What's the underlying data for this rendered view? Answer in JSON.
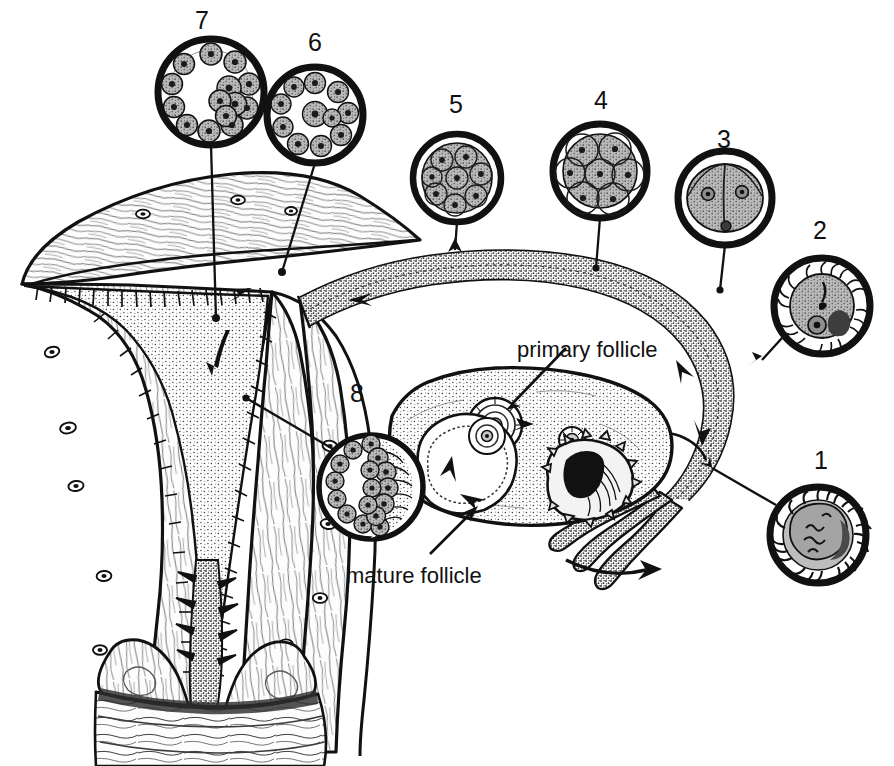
{
  "figure": {
    "background_color": "#ffffff",
    "ink_color": "#111111",
    "fill_gray": "#9a9a9a",
    "fill_light": "#f4f4f4",
    "width": 894,
    "height": 766
  },
  "text_labels": [
    {
      "id": "primary-follicle",
      "text": "primary follicle",
      "x": 517,
      "y": 339
    },
    {
      "id": "mature-follicle",
      "text": "mature follicle",
      "x": 346,
      "y": 565
    }
  ],
  "stage_numbers": [
    {
      "id": "stage-7",
      "label": "7",
      "x": 195,
      "y": 8,
      "stage_name": "blastocyst"
    },
    {
      "id": "stage-6",
      "label": "6",
      "x": 308,
      "y": 30,
      "stage_name": "early blastocyst"
    },
    {
      "id": "stage-5",
      "label": "5",
      "x": 449,
      "y": 92,
      "stage_name": "morula"
    },
    {
      "id": "stage-4",
      "label": "4",
      "x": 594,
      "y": 88,
      "stage_name": "eight-cell stage"
    },
    {
      "id": "stage-3",
      "label": "3",
      "x": 717,
      "y": 127,
      "stage_name": "two-cell stage"
    },
    {
      "id": "stage-2",
      "label": "2",
      "x": 813,
      "y": 218,
      "stage_name": "zygote"
    },
    {
      "id": "stage-1",
      "label": "1",
      "x": 814,
      "y": 448,
      "stage_name": "fertilization"
    },
    {
      "id": "stage-8",
      "label": "8",
      "x": 350,
      "y": 381,
      "stage_name": "implantation"
    }
  ],
  "inset_circles": [
    {
      "id": "inset-7",
      "cx": 211,
      "cy": 92,
      "r": 53,
      "stage": "7"
    },
    {
      "id": "inset-6",
      "cx": 315,
      "cy": 115,
      "r": 48,
      "stage": "6"
    },
    {
      "id": "inset-5",
      "cx": 457,
      "cy": 178,
      "r": 44,
      "stage": "5"
    },
    {
      "id": "inset-4",
      "cx": 600,
      "cy": 171,
      "r": 47,
      "stage": "4"
    },
    {
      "id": "inset-3",
      "cx": 725,
      "cy": 198,
      "r": 47,
      "stage": "3"
    },
    {
      "id": "inset-2",
      "cx": 822,
      "cy": 306,
      "r": 48,
      "stage": "2"
    },
    {
      "id": "inset-1",
      "cx": 818,
      "cy": 535,
      "r": 48,
      "stage": "1"
    },
    {
      "id": "inset-8",
      "cx": 371,
      "cy": 487,
      "r": 52,
      "stage": "8"
    }
  ],
  "anatomy_parts": [
    {
      "id": "uterus-body",
      "name": "uterus"
    },
    {
      "id": "uterine-cavity",
      "name": "uterine cavity / endometrium"
    },
    {
      "id": "cervix",
      "name": "cervix"
    },
    {
      "id": "vagina",
      "name": "vagina"
    },
    {
      "id": "fallopian-tube",
      "name": "fallopian tube"
    },
    {
      "id": "fimbriae",
      "name": "fimbriae"
    },
    {
      "id": "ovary",
      "name": "ovary"
    },
    {
      "id": "broad-ligament",
      "name": "broad ligament"
    },
    {
      "id": "corpus-luteum",
      "name": "corpus luteum"
    }
  ]
}
